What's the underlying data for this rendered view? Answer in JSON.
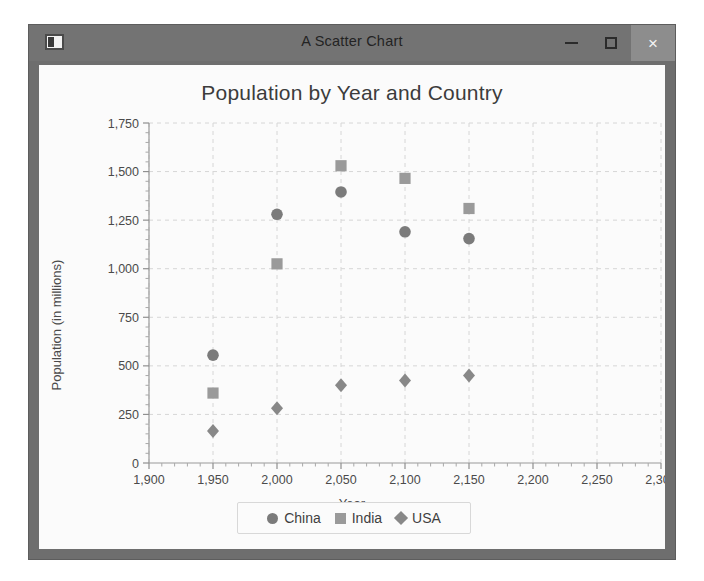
{
  "window": {
    "title": "A Scatter Chart",
    "icon": "app-icon",
    "controls": {
      "minimize": "–",
      "maximize": "□",
      "close": "×"
    }
  },
  "legend": {
    "items": [
      {
        "label": "China",
        "marker": "circle",
        "color": "#7b7b7b"
      },
      {
        "label": "India",
        "marker": "square",
        "color": "#9a9a9a"
      },
      {
        "label": "USA",
        "marker": "diamond",
        "color": "#888888"
      }
    ]
  },
  "chart_data": {
    "type": "scatter",
    "title": "Population by Year and Country",
    "xlabel": "Year",
    "ylabel": "Population (in millions)",
    "xlim": [
      1900,
      2300
    ],
    "ylim": [
      0,
      1750
    ],
    "xticks": [
      1900,
      1950,
      2000,
      2050,
      2100,
      2150,
      2200,
      2250,
      2300
    ],
    "xticklabels": [
      "1,900",
      "1,950",
      "2,000",
      "2,050",
      "2,100",
      "2,150",
      "2,200",
      "2,250",
      "2,300"
    ],
    "yticks": [
      0,
      250,
      500,
      750,
      1000,
      1250,
      1500,
      1750
    ],
    "yticklabels": [
      "0",
      "250",
      "500",
      "750",
      "1,000",
      "1,250",
      "1,500",
      "1,750"
    ],
    "grid": true,
    "grid_style": "dashed",
    "minor_ticks": true,
    "legend_position": "bottom",
    "series": [
      {
        "name": "China",
        "marker": "circle",
        "color": "#7b7b7b",
        "points": [
          {
            "x": 1950,
            "y": 555
          },
          {
            "x": 2000,
            "y": 1280
          },
          {
            "x": 2050,
            "y": 1395
          },
          {
            "x": 2100,
            "y": 1190
          },
          {
            "x": 2150,
            "y": 1155
          }
        ]
      },
      {
        "name": "India",
        "marker": "square",
        "color": "#9a9a9a",
        "points": [
          {
            "x": 1950,
            "y": 360
          },
          {
            "x": 2000,
            "y": 1025
          },
          {
            "x": 2050,
            "y": 1530
          },
          {
            "x": 2100,
            "y": 1465
          },
          {
            "x": 2150,
            "y": 1310
          }
        ]
      },
      {
        "name": "USA",
        "marker": "diamond",
        "color": "#888888",
        "points": [
          {
            "x": 1950,
            "y": 165
          },
          {
            "x": 2000,
            "y": 282
          },
          {
            "x": 2050,
            "y": 400
          },
          {
            "x": 2100,
            "y": 425
          },
          {
            "x": 2150,
            "y": 450
          }
        ]
      }
    ]
  }
}
